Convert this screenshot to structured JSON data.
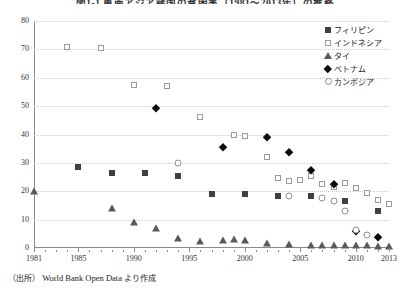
{
  "chart_data": {
    "type": "scatter",
    "title": "図1-1 東南アジア諸国の貧困率（1981～2013年）の推移",
    "xlabel": "",
    "ylabel": "",
    "xlim": [
      1981,
      2013
    ],
    "ylim": [
      0,
      80
    ],
    "ytick_step": 10,
    "yticks": [
      0,
      10,
      20,
      30,
      40,
      50,
      60,
      70,
      80
    ],
    "xticks": [
      1981,
      1985,
      1990,
      1995,
      2000,
      2005,
      2010,
      2013
    ],
    "grid": "horizontal-dotted",
    "legend_position": "top-right",
    "series": [
      {
        "name": "フィリピン",
        "marker": "filled-square",
        "color": "#404040",
        "points": [
          [
            1985,
            28.5
          ],
          [
            1988,
            26.5
          ],
          [
            1991,
            26.5
          ],
          [
            1994,
            25.5
          ],
          [
            1997,
            19.0
          ],
          [
            2000,
            19.2
          ],
          [
            2003,
            18.5
          ],
          [
            2006,
            18.4
          ],
          [
            2009,
            16.5
          ],
          [
            2012,
            13.1
          ]
        ]
      },
      {
        "name": "インドネシア",
        "marker": "open-square",
        "color": "#9a9a9a",
        "points": [
          [
            1984,
            70.8
          ],
          [
            1987,
            70.6
          ],
          [
            1990,
            57.3
          ],
          [
            1993,
            57.0
          ],
          [
            1996,
            46.0
          ],
          [
            1999,
            40.0
          ],
          [
            2000,
            39.5
          ],
          [
            2002,
            32.0
          ],
          [
            2003,
            24.5
          ],
          [
            2004,
            23.5
          ],
          [
            2005,
            24.0
          ],
          [
            2006,
            25.5
          ],
          [
            2007,
            22.5
          ],
          [
            2008,
            21.5
          ],
          [
            2009,
            23.0
          ],
          [
            2010,
            21.0
          ],
          [
            2011,
            19.5
          ],
          [
            2012,
            17.0
          ],
          [
            2013,
            15.5
          ]
        ]
      },
      {
        "name": "タイ",
        "marker": "filled-triangle",
        "color": "#5a5a5a",
        "points": [
          [
            1981,
            20.0
          ],
          [
            1988,
            14.0
          ],
          [
            1990,
            9.0
          ],
          [
            1992,
            7.0
          ],
          [
            1994,
            3.5
          ],
          [
            1996,
            2.5
          ],
          [
            1998,
            2.8
          ],
          [
            1999,
            3.2
          ],
          [
            2000,
            2.8
          ],
          [
            2002,
            1.8
          ],
          [
            2004,
            1.5
          ],
          [
            2006,
            1.2
          ],
          [
            2007,
            1.2
          ],
          [
            2008,
            1.0
          ],
          [
            2009,
            1.0
          ],
          [
            2010,
            1.0
          ],
          [
            2011,
            1.0
          ],
          [
            2012,
            0.8
          ],
          [
            2013,
            0.8
          ]
        ]
      },
      {
        "name": "ベトナム",
        "marker": "filled-diamond",
        "color": "#0d0d0d",
        "points": [
          [
            1992,
            49.5
          ],
          [
            1998,
            35.5
          ],
          [
            2002,
            39.0
          ],
          [
            2004,
            34.0
          ],
          [
            2006,
            27.5
          ],
          [
            2008,
            22.5
          ],
          [
            2010,
            6.0
          ],
          [
            2012,
            4.0
          ]
        ]
      },
      {
        "name": "カンボジア",
        "marker": "open-circle",
        "color": "#8e8e8e",
        "points": [
          [
            1994,
            30.0
          ],
          [
            2004,
            18.5
          ],
          [
            2007,
            17.5
          ],
          [
            2008,
            16.5
          ],
          [
            2009,
            13.0
          ],
          [
            2010,
            6.5
          ],
          [
            2011,
            4.5
          ]
        ]
      }
    ]
  },
  "legend": {
    "items": [
      {
        "label": "フィリピン",
        "marker": "filled-square"
      },
      {
        "label": "インドネシア",
        "marker": "open-square"
      },
      {
        "label": "タイ",
        "marker": "filled-triangle"
      },
      {
        "label": "ベトナム",
        "marker": "filled-diamond"
      },
      {
        "label": "カンボジア",
        "marker": "open-circle"
      }
    ]
  },
  "source": {
    "prefix": "（出所）",
    "text": "World Bank Open Data",
    "suffix": "より作成"
  }
}
